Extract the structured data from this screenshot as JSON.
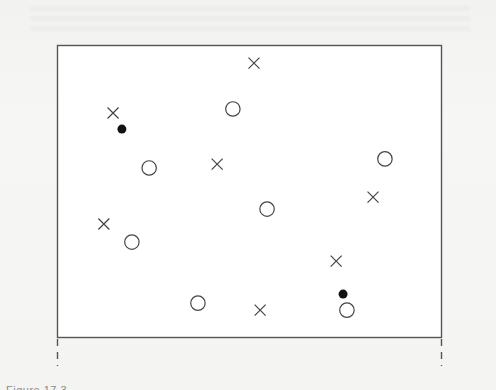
{
  "caption": "Figure 17.3",
  "chart_data": {
    "type": "scatter",
    "title": "",
    "xlabel": "",
    "ylabel": "",
    "xlim": [
      0,
      100
    ],
    "ylim": [
      0,
      100
    ],
    "grid": false,
    "legend": null,
    "frame": {
      "left_px": 57,
      "top_px": 45,
      "right_px": 441,
      "bottom_px": 337
    },
    "series": [
      {
        "name": "class-cross",
        "marker": "x",
        "color": "#444444",
        "points": [
          {
            "x": 51.3,
            "y": 93.8
          },
          {
            "x": 14.6,
            "y": 76.7
          },
          {
            "x": 41.7,
            "y": 59.2
          },
          {
            "x": 82.3,
            "y": 47.9
          },
          {
            "x": 12.2,
            "y": 38.7
          },
          {
            "x": 72.7,
            "y": 26.0
          },
          {
            "x": 52.9,
            "y": 9.2
          }
        ]
      },
      {
        "name": "class-circle",
        "marker": "open-circle",
        "color": "#444444",
        "points": [
          {
            "x": 45.8,
            "y": 78.1
          },
          {
            "x": 24.0,
            "y": 57.9
          },
          {
            "x": 85.4,
            "y": 61.0
          },
          {
            "x": 54.7,
            "y": 43.8
          },
          {
            "x": 19.5,
            "y": 32.5
          },
          {
            "x": 36.7,
            "y": 11.6
          },
          {
            "x": 75.5,
            "y": 9.2
          }
        ]
      },
      {
        "name": "filled-point",
        "marker": "filled-circle",
        "color": "#111111",
        "points": [
          {
            "x": 16.9,
            "y": 71.2
          },
          {
            "x": 74.5,
            "y": 14.7
          }
        ]
      }
    ]
  }
}
